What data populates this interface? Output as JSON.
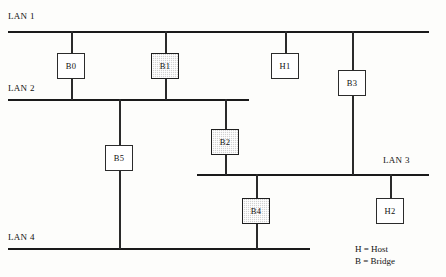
{
  "diagram": {
    "legend": {
      "host_line": "H = Host",
      "bridge_line": "B = Bridge"
    },
    "lans": [
      {
        "id": "lan1",
        "label": "LAN 1"
      },
      {
        "id": "lan2",
        "label": "LAN 2"
      },
      {
        "id": "lan3",
        "label": "LAN 3"
      },
      {
        "id": "lan4",
        "label": "LAN 4"
      }
    ],
    "nodes": [
      {
        "id": "b0",
        "label": "B0",
        "type": "bridge",
        "shaded": false
      },
      {
        "id": "b1",
        "label": "B1",
        "type": "bridge",
        "shaded": true
      },
      {
        "id": "h1",
        "label": "H1",
        "type": "host",
        "shaded": false
      },
      {
        "id": "b3",
        "label": "B3",
        "type": "bridge",
        "shaded": false
      },
      {
        "id": "b2",
        "label": "B2",
        "type": "bridge",
        "shaded": true
      },
      {
        "id": "b5",
        "label": "B5",
        "type": "bridge",
        "shaded": false
      },
      {
        "id": "b4",
        "label": "B4",
        "type": "bridge",
        "shaded": true
      },
      {
        "id": "h2",
        "label": "H2",
        "type": "host",
        "shaded": false
      }
    ],
    "colors": {
      "line": "#1a1a1a",
      "node_fill": "#ffffff",
      "node_shaded_fill": "#d2d2d2",
      "text": "#111111",
      "background": "#fdfdfb"
    }
  }
}
